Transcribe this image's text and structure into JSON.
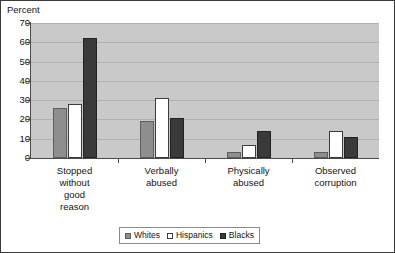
{
  "chart_data": {
    "type": "bar",
    "title": "",
    "ylabel": "Percent",
    "xlabel": "",
    "ylim": [
      0,
      70
    ],
    "ytick_step": 10,
    "yticks": [
      70,
      60,
      50,
      40,
      30,
      20,
      10,
      0
    ],
    "grid": true,
    "legend_position": "bottom-center",
    "categories": [
      "Stopped without good reason",
      "Verbally abused",
      "Physically abused",
      "Observed corruption"
    ],
    "category_label_lines": [
      [
        "Stopped",
        "without",
        "good",
        "reason"
      ],
      [
        "Verbally",
        "abused"
      ],
      [
        "Physically",
        "abused"
      ],
      [
        "Observed",
        "corruption"
      ]
    ],
    "series": [
      {
        "name": "Whites",
        "color": "#8e8e8e",
        "values": [
          26,
          19,
          3,
          3
        ]
      },
      {
        "name": "Hispanics",
        "color": "#ffffff",
        "values": [
          28,
          31,
          7,
          14
        ]
      },
      {
        "name": "Blacks",
        "color": "#3a3a3a",
        "values": [
          62,
          21,
          14,
          11
        ]
      }
    ]
  },
  "legend": {
    "items": [
      {
        "label": "Whites"
      },
      {
        "label": "Hispanics"
      },
      {
        "label": "Blacks"
      }
    ]
  },
  "colors": {
    "plot_background": "#c9c9c9",
    "gridline": "#b0b0b0",
    "axis": "#4a4a4a",
    "figure_border": "#3a3a3a",
    "text": "#141414"
  }
}
